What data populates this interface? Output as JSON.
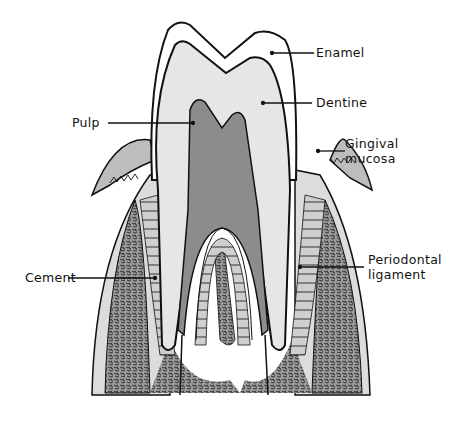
{
  "labels": {
    "enamel": "Enamel",
    "dentine": "Dentine",
    "pulp": "Pulp",
    "gingival_line1": "Gingival",
    "gingival_line2": "mucosa",
    "cement": "Cement",
    "periodontal_line1": "Periodontal",
    "periodontal_line2": "ligament"
  },
  "colors": {
    "enamel": "#ffffff",
    "dentine": "#e6e6e6",
    "pulp": "#8c8c8c",
    "gingiva": "#bdbdbd",
    "bone": "#8a8a8a",
    "ligament": "#cfcfcf",
    "outline": "#111111"
  }
}
